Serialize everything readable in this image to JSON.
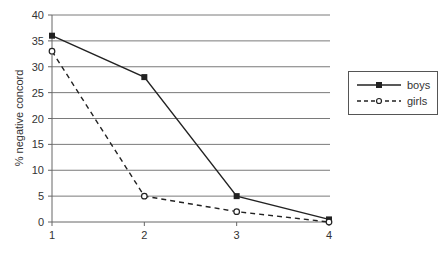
{
  "chart_data": {
    "type": "line",
    "title": "",
    "xlabel": "",
    "ylabel": "% negative concord",
    "x": [
      1,
      2,
      3,
      4
    ],
    "xticks": [
      "1",
      "2",
      "3",
      "4"
    ],
    "yticks": [
      "0",
      "5",
      "10",
      "15",
      "20",
      "25",
      "30",
      "35",
      "40"
    ],
    "ylim": [
      0,
      40
    ],
    "grid": "horizontal",
    "legend_position": "right",
    "series": [
      {
        "name": "boys",
        "values": [
          36,
          28,
          5,
          0.5
        ],
        "line": "solid",
        "marker": "filled-square",
        "color": "#222222"
      },
      {
        "name": "girls",
        "values": [
          33,
          5,
          2,
          0
        ],
        "line": "dashed",
        "marker": "open-circle",
        "color": "#222222"
      }
    ]
  },
  "legend": {
    "items": [
      {
        "label": "boys"
      },
      {
        "label": "girls"
      }
    ]
  }
}
